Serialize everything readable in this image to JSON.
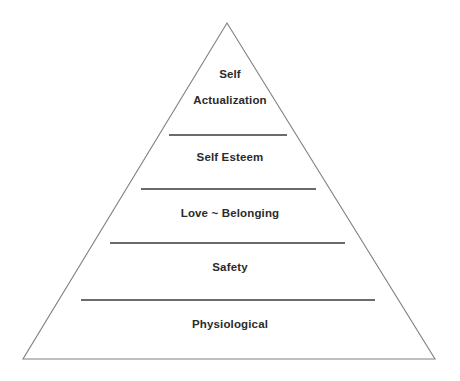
{
  "diagram": {
    "type": "pyramid",
    "name": "Maslow's Hierarchy of Needs",
    "background_color": "#ffffff",
    "outline_color": "#808080",
    "divider_color": "#3a3a3a",
    "text_color": "#2b2b2b",
    "apex": {
      "x": 227,
      "y": 23
    },
    "base_left": {
      "x": 23,
      "y": 359
    },
    "base_right": {
      "x": 435,
      "y": 359
    },
    "tiers": [
      {
        "level": 5,
        "lines": [
          "Self",
          "Actualization"
        ],
        "label": "Self Actualization",
        "label_center_y": 87,
        "line_y": [
          73,
          100
        ]
      },
      {
        "level": 4,
        "lines": [
          "Self Esteem"
        ],
        "label": "Self Esteem",
        "label_center_y": 157,
        "line_y": [
          157
        ]
      },
      {
        "level": 3,
        "lines": [
          "Love ~ Belonging"
        ],
        "label": "Love ~ Belonging",
        "label_center_y": 213,
        "line_y": [
          213
        ]
      },
      {
        "level": 2,
        "lines": [
          "Safety"
        ],
        "label": "Safety",
        "label_center_y": 267,
        "line_y": [
          267
        ]
      },
      {
        "level": 1,
        "lines": [
          "Physiological"
        ],
        "label": "Physiological",
        "label_center_y": 324,
        "line_y": [
          324
        ]
      }
    ],
    "dividers": [
      {
        "index": 0,
        "y": 135,
        "x1": 169,
        "x2": 287
      },
      {
        "index": 1,
        "y": 189,
        "x1": 141,
        "x2": 316
      },
      {
        "index": 2,
        "y": 243,
        "x1": 110,
        "x2": 345
      },
      {
        "index": 3,
        "y": 300,
        "x1": 81,
        "x2": 375
      }
    ]
  }
}
